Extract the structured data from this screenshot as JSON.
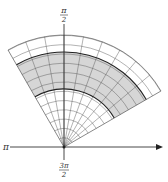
{
  "diagram": {
    "type": "polar-region",
    "labels": {
      "top": {
        "num": "π",
        "den": "2"
      },
      "left": "π",
      "bottom": {
        "num": "3π",
        "den": "2"
      }
    },
    "wedge": {
      "theta_start_deg": 30,
      "theta_end_deg": 120,
      "r_outer": 112,
      "shaded_r_inner": 58,
      "shaded_r_outer": 95
    },
    "colors": {
      "shade": "#d6d6d6",
      "grid": "#555555",
      "axis": "#333333",
      "boundary": "#222222"
    }
  }
}
